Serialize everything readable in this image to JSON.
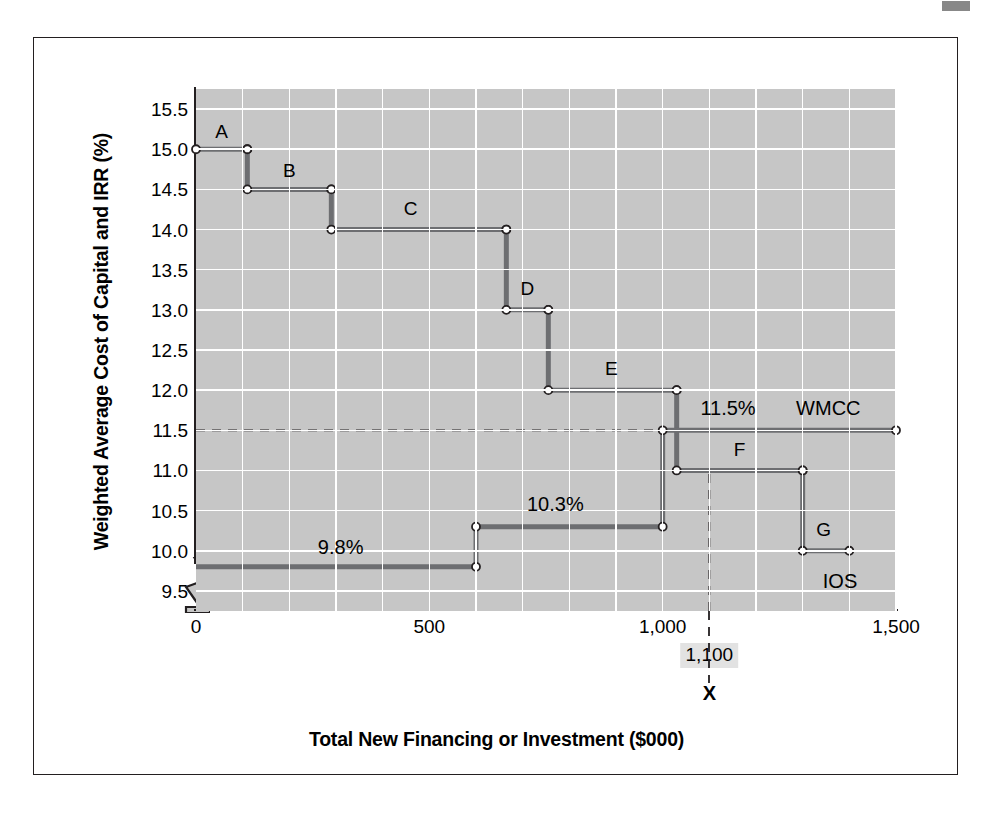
{
  "figure": {
    "y_axis_title": "Weighted Average Cost of Capital and IRR (%)",
    "x_axis_title": "Total New Financing or Investment ($000)",
    "x_marker_label": "1,100",
    "x_marker_letter": "X",
    "plot_bg_color": "#c6c6c6",
    "grid_color": "#ffffff",
    "series_color": "#6d6e71",
    "frame_color": "#231f20"
  },
  "chart_data": {
    "type": "line",
    "title": "",
    "subtitle": "",
    "xlabel": "Total New Financing or Investment ($000)",
    "ylabel": "Weighted Average Cost of Capital and IRR (%)",
    "xlim": [
      0,
      1500
    ],
    "ylim": [
      9.25,
      15.75
    ],
    "grid": true,
    "legend": "in-plot labels",
    "x_ticks": [
      0,
      500,
      1000,
      1500
    ],
    "x_tick_labels": [
      "0",
      "500",
      "1,000",
      "1,500"
    ],
    "x_gridline_step": 100,
    "y_ticks": [
      9.5,
      10.0,
      10.5,
      11.0,
      11.5,
      12.0,
      12.5,
      13.0,
      13.5,
      14.0,
      14.5,
      15.0,
      15.5
    ],
    "y_tick_labels": [
      "9.5",
      "10.0",
      "10.5",
      "11.0",
      "11.5",
      "12.0",
      "12.5",
      "13.0",
      "13.5",
      "14.0",
      "14.5",
      "15.0",
      "15.5"
    ],
    "y_axis_break": true,
    "series": [
      {
        "name": "IOS",
        "label": "IOS",
        "description": "Investment opportunities schedule - step-down schedule of project IRRs",
        "steps": [
          {
            "id": "A",
            "label": "A",
            "irr": 15.0,
            "x_start": 0,
            "x_end": 110
          },
          {
            "id": "B",
            "label": "B",
            "irr": 14.5,
            "x_start": 110,
            "x_end": 290
          },
          {
            "id": "C",
            "label": "C",
            "irr": 14.0,
            "x_start": 290,
            "x_end": 665
          },
          {
            "id": "D",
            "label": "D",
            "irr": 13.0,
            "x_start": 665,
            "x_end": 755
          },
          {
            "id": "E",
            "label": "E",
            "irr": 12.0,
            "x_start": 755,
            "x_end": 1030
          },
          {
            "id": "F",
            "label": "F",
            "irr": 11.0,
            "x_start": 1030,
            "x_end": 1300
          },
          {
            "id": "G",
            "label": "G",
            "irr": 10.0,
            "x_start": 1300,
            "x_end": 1400
          }
        ]
      },
      {
        "name": "WMCC",
        "label": "WMCC",
        "description": "Weighted marginal cost of capital schedule",
        "steps": [
          {
            "value": 9.8,
            "label": "9.8%",
            "x_start": 0,
            "x_end": 600
          },
          {
            "value": 10.3,
            "label": "10.3%",
            "x_start": 600,
            "x_end": 1000
          },
          {
            "value": 11.5,
            "label": "11.5%",
            "x_start": 1000,
            "x_end": 1500
          }
        ]
      }
    ],
    "annotations": [
      {
        "text": "A",
        "x": 55,
        "y": 15.22
      },
      {
        "text": "B",
        "x": 200,
        "y": 14.73
      },
      {
        "text": "C",
        "x": 460,
        "y": 14.25
      },
      {
        "text": "D",
        "x": 710,
        "y": 13.26
      },
      {
        "text": "E",
        "x": 890,
        "y": 12.26
      },
      {
        "text": "F",
        "x": 1165,
        "y": 11.26
      },
      {
        "text": "G",
        "x": 1345,
        "y": 10.26
      },
      {
        "text": "9.8%",
        "x": 310,
        "y": 10.05
      },
      {
        "text": "10.3%",
        "x": 770,
        "y": 10.58
      },
      {
        "text": "11.5%",
        "x": 1140,
        "y": 11.78
      },
      {
        "text": "WMCC",
        "x": 1355,
        "y": 11.78
      },
      {
        "text": "IOS",
        "x": 1380,
        "y": 9.62
      }
    ],
    "reference_lines": [
      {
        "orientation": "horizontal",
        "value": 11.5,
        "style": "dashed",
        "x_from": 0,
        "x_to": 1000
      },
      {
        "orientation": "vertical",
        "value": 1100,
        "style": "dashed",
        "y_from": 9.25,
        "y_to": 11.0
      }
    ]
  }
}
